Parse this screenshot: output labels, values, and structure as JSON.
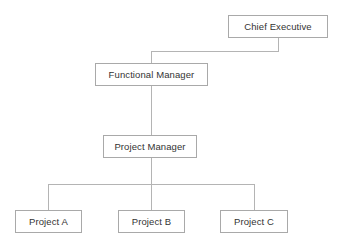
{
  "diagram": {
    "background_color": "#ffffff",
    "box_border_color": "#a9a9a9",
    "box_fill_color": "#ffffff",
    "connector_color": "#b4b4b4",
    "label_color": "#333333",
    "nodes": [
      {
        "id": "chief-executive",
        "label": "Chief Executive",
        "level": 0,
        "x": 228,
        "y": 15,
        "width": 100,
        "height": 23
      },
      {
        "id": "functional-manager",
        "label": "Functional Manager",
        "level": 1,
        "x": 95,
        "y": 63,
        "width": 113,
        "height": 23
      },
      {
        "id": "project-manager",
        "label": "Project Manager",
        "level": 2,
        "x": 103,
        "y": 135,
        "width": 94,
        "height": 23
      },
      {
        "id": "project-a",
        "label": "Project A",
        "level": 3,
        "x": 15,
        "y": 210,
        "width": 67,
        "height": 23
      },
      {
        "id": "project-b",
        "label": "Project B",
        "level": 3,
        "x": 118,
        "y": 210,
        "width": 67,
        "height": 23
      },
      {
        "id": "project-c",
        "label": "Project C",
        "level": 3,
        "x": 220,
        "y": 210,
        "width": 68,
        "height": 23
      }
    ],
    "edges": [
      {
        "id": "edge-ce-fm",
        "from": "chief-executive",
        "to": "functional-manager",
        "style": "elbow"
      },
      {
        "id": "edge-fm-pm",
        "from": "functional-manager",
        "to": "project-manager",
        "style": "straight"
      },
      {
        "id": "edge-pm-pa",
        "from": "project-manager",
        "to": "project-a",
        "style": "elbow"
      },
      {
        "id": "edge-pm-pb",
        "from": "project-manager",
        "to": "project-b",
        "style": "straight"
      },
      {
        "id": "edge-pm-pc",
        "from": "project-manager",
        "to": "project-c",
        "style": "elbow"
      }
    ]
  }
}
